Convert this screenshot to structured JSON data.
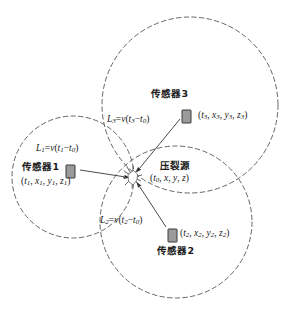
{
  "figure": {
    "type": "schematic-diagram",
    "colors": {
      "stroke": "#555555",
      "text": "#1a1a1a",
      "sensor_fill": "#9a9a9a",
      "sensor_border": "#3a3a3a",
      "background": "#ffffff"
    }
  },
  "labels": {
    "sensor1": "传感器1",
    "sensor1_coords": "(t1, x1, y1, z1)",
    "sensor2": "传感器2",
    "sensor2_coords": "(t2, x2, y2, z2)",
    "sensor3": "传感器3",
    "sensor3_coords": "(t3, x3, y3, z3)",
    "source": "压裂源",
    "source_coords": "(t0, x, y, z)",
    "L1": "L1=v(t1−t0)",
    "L2": "L2=v(t2−t0)",
    "L3": "L3=v(t3−t0)"
  },
  "geometry": {
    "source_point": {
      "x": 133,
      "y": 177
    },
    "circles": [
      {
        "name": "circle-sensor1",
        "cx": 73,
        "cy": 177,
        "r": 61
      },
      {
        "name": "circle-sensor3",
        "cx": 190,
        "cy": 105,
        "r": 88
      },
      {
        "name": "circle-sensor2",
        "cx": 176,
        "cy": 222,
        "r": 76
      }
    ],
    "sensors": [
      {
        "name": "sensor1",
        "x": 66,
        "y": 165,
        "w": 9,
        "h": 13
      },
      {
        "name": "sensor2",
        "x": 168,
        "y": 229,
        "w": 9,
        "h": 13
      },
      {
        "name": "sensor3",
        "x": 182,
        "y": 110,
        "w": 9,
        "h": 13
      }
    ],
    "arrows": [
      {
        "name": "arrow-sensor1-to-source",
        "from": {
          "x": 80,
          "y": 170
        },
        "to": {
          "x": 130,
          "y": 178
        }
      },
      {
        "name": "arrow-sensor3-to-source",
        "from": {
          "x": 180,
          "y": 118
        },
        "to": {
          "x": 136,
          "y": 172
        }
      },
      {
        "name": "arrow-sensor2-to-source",
        "from": {
          "x": 166,
          "y": 228
        },
        "to": {
          "x": 137,
          "y": 182
        }
      }
    ]
  }
}
